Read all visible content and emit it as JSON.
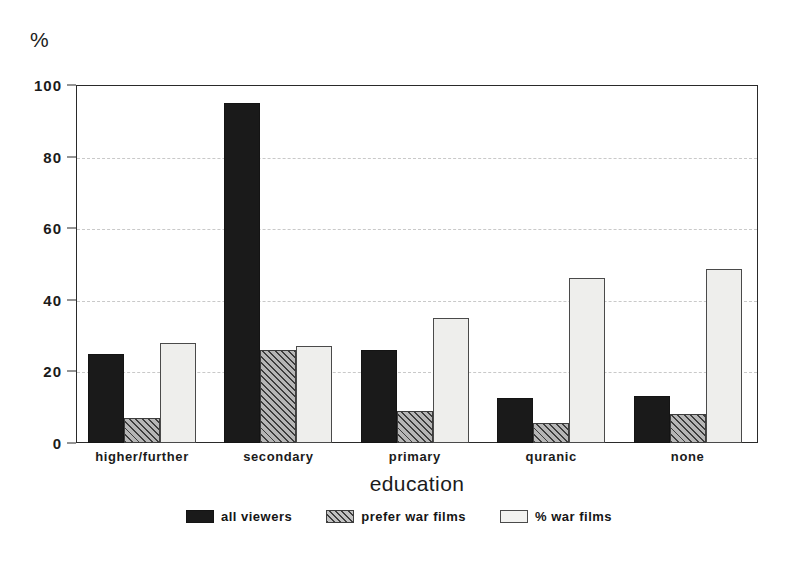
{
  "chart_data": {
    "type": "bar",
    "title": "",
    "unit_label": "%",
    "xlabel": "education",
    "ylabel": "%",
    "categories": [
      "higher/further",
      "secondary",
      "primary",
      "quranic",
      "none"
    ],
    "series": [
      {
        "name": "all viewers",
        "values": [
          25,
          95,
          26,
          12.5,
          13
        ]
      },
      {
        "name": "prefer war films",
        "values": [
          7,
          26,
          9,
          5.5,
          8
        ]
      },
      {
        "name": "% war films",
        "values": [
          28,
          27,
          35,
          46,
          48.5
        ]
      }
    ],
    "ylim": [
      0,
      100
    ],
    "yticks": [
      0,
      20,
      40,
      60,
      80,
      100
    ],
    "ytick_labels": [
      "0",
      "20",
      "40",
      "60",
      "80",
      "100"
    ],
    "grid": true,
    "grid_axis": "y",
    "legend_position": "bottom-center",
    "colors": {
      "series_0": "#1a1a1a",
      "series_1": "#b6b6b6",
      "series_2": "#eeeeec",
      "axis": "#2a2a2a",
      "grid": "#c9c9c9",
      "background": "#ffffff"
    }
  }
}
